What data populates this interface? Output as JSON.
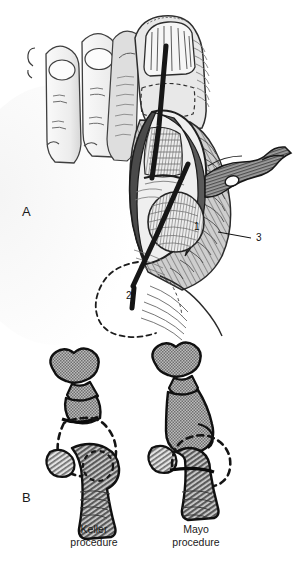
{
  "figure": {
    "background_color": "#ffffff",
    "ink_color": "#111111",
    "bone_fill": "#8a8a8a",
    "soft_tissue_fill": "#d9d9d9",
    "highlight_fill": "#f2f2f2"
  },
  "panels": [
    {
      "id": "panel-a",
      "letter": "A",
      "letter_x": 22,
      "letter_y": 216,
      "description": "Dorsomedial view of the forefoot with a medial longitudinal incision over the first metatarsophalangeal joint, soft tissues retracted with a retractor, exposing the metatarsal head. Dashed line marks the outline of the bunion prominence.",
      "callouts": [
        {
          "label": "1",
          "x": 194,
          "y": 230,
          "target": "metatarsal head"
        },
        {
          "label": "2",
          "x": 126,
          "y": 299,
          "target": "medial eminence marking"
        },
        {
          "label": "3",
          "x": 256,
          "y": 241,
          "target": "capsule flap / retractor"
        }
      ],
      "leader_lines": [
        {
          "from_x": 218,
          "from_y": 232,
          "to_x": 251,
          "to_y": 238
        }
      ]
    },
    {
      "id": "panel-b",
      "letter": "B",
      "letter_x": 22,
      "letter_y": 502,
      "description": "Comparison of two resection arthroplasty techniques of the first metatarsophalangeal joint shown in lateral profile. Dashed outlines indicate the bone removed.",
      "diagrams": [
        {
          "id": "keller",
          "caption_line_1": "Keller",
          "caption_line_2": "procedure",
          "caption_x": 94,
          "caption_line_1_y": 533,
          "caption_line_2_y": 546,
          "resected_part": "base of the proximal phalanx"
        },
        {
          "id": "mayo",
          "caption_line_1": "Mayo",
          "caption_line_2": "procedure",
          "caption_x": 196,
          "caption_line_1_y": 533,
          "caption_line_2_y": 546,
          "resected_part": "head of the first metatarsal"
        }
      ]
    }
  ]
}
